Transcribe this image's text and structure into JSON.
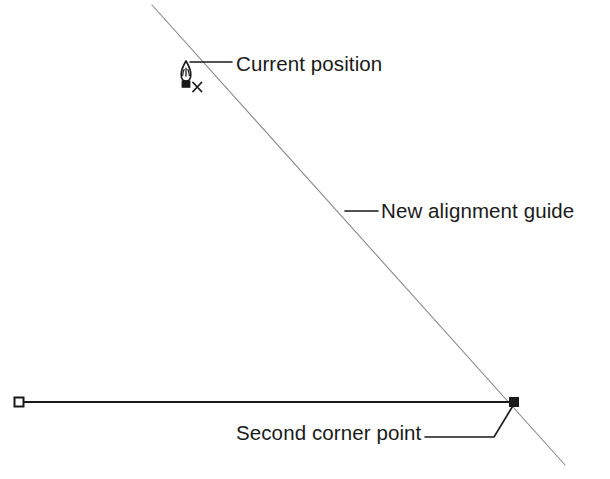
{
  "figure": {
    "type": "technical-line-diagram",
    "background_color": "#ffffff",
    "ink_color": "#1a1a1a",
    "guide_color": "#7d7d7d"
  },
  "labels": {
    "current_position": "Current position",
    "new_alignment_guide": "New alignment guide",
    "second_corner_point": "Second corner point"
  },
  "icons": {
    "cursor": "pen-nib-cursor-icon",
    "cursor_badge": "x-badge-icon",
    "start_point_marker": "hollow-square-node-icon",
    "corner_point_marker": "filled-square-node-icon"
  },
  "geometry": {
    "alignment_guide_line": {
      "name": "new-alignment-guide-line",
      "x1": 152,
      "y1": 5,
      "x2": 565,
      "y2": 465,
      "stroke": "#8a8a8a",
      "stroke_width": 1.1
    },
    "horizontal_rectangle_edge": {
      "name": "horizontal-edge-line",
      "x1": 20,
      "y1": 402,
      "x2": 514,
      "y2": 402,
      "stroke": "#1a1a1a",
      "stroke_width": 2.2
    },
    "start_point": {
      "x": 19,
      "y": 402,
      "size": 9
    },
    "corner_point": {
      "x": 514,
      "y": 402,
      "size": 9
    },
    "cursor_position": {
      "x": 186,
      "y": 80
    },
    "leaders": [
      {
        "name": "current-position-leader",
        "points": "190,62 232,62",
        "stroke_width": 1.6
      },
      {
        "name": "new-alignment-guide-leader",
        "points": "345,211 378,211",
        "stroke_width": 1.6
      },
      {
        "name": "second-corner-point-leader",
        "points": "425,437 494,437 514,404",
        "stroke_width": 1.6
      }
    ]
  }
}
